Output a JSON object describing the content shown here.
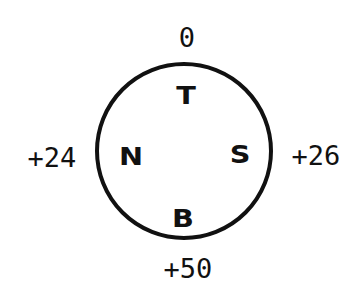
{
  "diagram": {
    "circle": {
      "cx": 184,
      "cy": 151,
      "r": 87,
      "stroke": "#111111",
      "stroke_width": 4
    },
    "inner_labels": {
      "top": "T",
      "left": "N",
      "right": "S",
      "bottom": "B"
    },
    "outer_labels": {
      "top": "0",
      "left": "+24",
      "right": "+26",
      "bottom": "+50"
    }
  }
}
